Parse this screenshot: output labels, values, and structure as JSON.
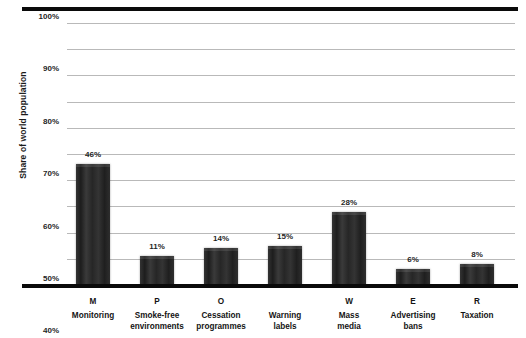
{
  "chart_data": {
    "type": "bar",
    "title": "",
    "xlabel": "",
    "ylabel": "Share of world population",
    "ylim": [
      0,
      100
    ],
    "grid": true,
    "legend": false,
    "categories": [
      "Monitoring",
      "Smoke-free environments",
      "Cessation programmes",
      "Warning labels",
      "Mass media",
      "Advertising bans",
      "Taxation"
    ],
    "category_letters": [
      "M",
      "P",
      "O",
      "W",
      "E",
      "R",
      ""
    ],
    "values": [
      46,
      11,
      14,
      15,
      28,
      6,
      8
    ],
    "value_labels": [
      "46%",
      "11%",
      "14%",
      "15%",
      "28%",
      "6%",
      "8%"
    ],
    "ytick_labels": [
      "100%",
      "90%",
      "80%",
      "70%",
      "60%",
      "50%",
      "40%",
      "30%",
      "20%",
      "10%",
      "0%"
    ],
    "ytick_values": [
      100,
      90,
      80,
      70,
      60,
      50,
      40,
      30,
      20,
      10,
      0
    ],
    "bar_color": "#2a2a2a",
    "gridline_color": "#b9b9b9",
    "axis_color": "#0a0a0a",
    "background_color": "#ffffff"
  },
  "axis": {
    "y_title": "Share of world population"
  },
  "categories": [
    {
      "letter": "M",
      "line1": "Monitoring",
      "line2": ""
    },
    {
      "letter": "P",
      "line1": "Smoke-free",
      "line2": "environments"
    },
    {
      "letter": "O",
      "line1": "Cessation",
      "line2": "programmes"
    },
    {
      "letter": "",
      "line1": "Warning",
      "line2": "labels"
    },
    {
      "letter": "W",
      "line1": "Mass",
      "line2": "media"
    },
    {
      "letter": "E",
      "line1": "Advertising",
      "line2": "bans"
    },
    {
      "letter": "R",
      "line1": "Taxation",
      "line2": ""
    }
  ]
}
